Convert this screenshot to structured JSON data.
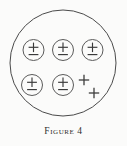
{
  "figure": {
    "caption_label": "Figure",
    "caption_number": "4",
    "background_color": "#fbfbfa",
    "line_color": "#4a4a4a",
    "width": 127,
    "height": 146
  },
  "diagram": {
    "name": "charged-particle-enclosure",
    "outer_boundary": {
      "name": "outer-circle",
      "shape": "circle",
      "cx": 63,
      "cy": 63,
      "r": 53,
      "stroke_color": "#4a4a4a"
    },
    "particles": [
      {
        "id": "particle-1",
        "symbol": "±",
        "plus_label": "+",
        "minus_label": "−",
        "cx": 33.5,
        "cy": 50,
        "r": 10.5,
        "circled": true
      },
      {
        "id": "particle-2",
        "symbol": "±",
        "plus_label": "+",
        "minus_label": "−",
        "cx": 63,
        "cy": 50,
        "r": 10.5,
        "circled": true
      },
      {
        "id": "particle-3",
        "symbol": "±",
        "plus_label": "+",
        "minus_label": "−",
        "cx": 92.5,
        "cy": 50,
        "r": 10.5,
        "circled": true
      },
      {
        "id": "particle-4",
        "symbol": "±",
        "plus_label": "+",
        "minus_label": "−",
        "cx": 32,
        "cy": 85,
        "r": 10.5,
        "circled": true
      },
      {
        "id": "particle-5",
        "symbol": "±",
        "plus_label": "+",
        "minus_label": "−",
        "cx": 63,
        "cy": 85,
        "r": 10.5,
        "circled": true
      }
    ],
    "free_charges": [
      {
        "id": "free-charge-1",
        "symbol": "+",
        "cx": 84,
        "cy": 80,
        "size": 5.2
      },
      {
        "id": "free-charge-2",
        "symbol": "+",
        "cx": 94,
        "cy": 93,
        "size": 5.2
      }
    ],
    "counts": {
      "circled_particles": 5,
      "free_plus_signs": 2
    }
  }
}
